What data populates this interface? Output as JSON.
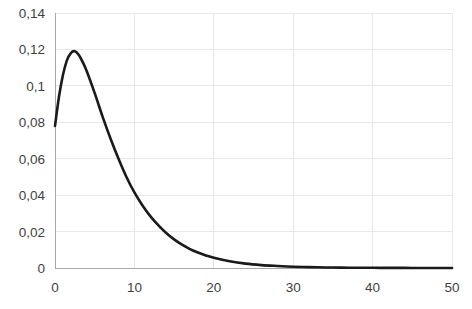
{
  "chart_data": {
    "type": "line",
    "title": "",
    "subtitle": "",
    "xlabel": "",
    "ylabel": "",
    "xlim": [
      0,
      50
    ],
    "ylim": [
      0,
      0.14
    ],
    "grid": true,
    "legend": false,
    "legend_position": "none",
    "decimal_separator": ",",
    "x_ticks": [
      0,
      10,
      20,
      30,
      40,
      50
    ],
    "x_tick_labels": [
      "0",
      "10",
      "20",
      "30",
      "40",
      "50"
    ],
    "y_ticks": [
      0,
      0.02,
      0.04,
      0.06,
      0.08,
      0.1,
      0.12,
      0.14
    ],
    "y_tick_labels": [
      "0",
      "0,02",
      "0,04",
      "0,06",
      "0,08",
      "0,1",
      "0,12",
      "0,14"
    ],
    "series": [
      {
        "name": "density",
        "color": "#1a1a1a",
        "x": [
          0,
          0.5,
          1,
          1.5,
          2,
          2.5,
          3,
          3.5,
          4,
          5,
          6,
          7,
          8,
          9,
          10,
          11,
          12,
          13,
          14,
          15,
          16,
          17,
          18,
          19,
          20,
          22,
          24,
          26,
          28,
          30,
          32,
          34,
          36,
          38,
          40,
          42,
          44,
          46,
          48,
          50
        ],
        "values": [
          0.078,
          0.094,
          0.106,
          0.114,
          0.118,
          0.119,
          0.117,
          0.113,
          0.108,
          0.096,
          0.083,
          0.071,
          0.06,
          0.05,
          0.0415,
          0.0345,
          0.0285,
          0.0235,
          0.0192,
          0.0157,
          0.0128,
          0.0104,
          0.0085,
          0.0069,
          0.0056,
          0.0037,
          0.0024,
          0.0016,
          0.0011,
          0.0007,
          0.0005,
          0.0003,
          0.0002,
          0.00015,
          0.0001,
          7e-05,
          5e-05,
          3e-05,
          2e-05,
          1e-05
        ]
      }
    ],
    "peak": {
      "x": 2.5,
      "y": 0.119
    },
    "start_value": 0.078
  },
  "colors": {
    "line": "#1a1a1a",
    "grid": "#e8e8e8",
    "axis": "#a6a6a6",
    "text": "#3f3f3f",
    "background": "#ffffff"
  },
  "geometry": {
    "plot_left": 55,
    "plot_right": 452,
    "plot_top": 13,
    "plot_bottom": 268,
    "width": 472,
    "height": 309
  }
}
